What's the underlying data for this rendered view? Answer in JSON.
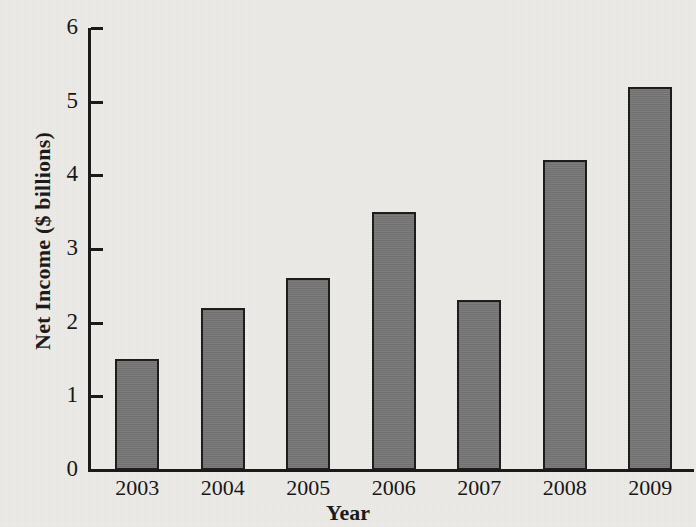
{
  "chart_data": {
    "type": "bar",
    "title": "",
    "xlabel": "Year",
    "ylabel": "Net Income ($ billions)",
    "categories": [
      "2003",
      "2004",
      "2005",
      "2006",
      "2007",
      "2008",
      "2009"
    ],
    "values": [
      1.5,
      2.2,
      2.6,
      3.5,
      2.3,
      4.2,
      5.2
    ],
    "ylim": [
      0,
      6
    ],
    "ytick_labels": [
      "0",
      "1",
      "2",
      "3",
      "4",
      "5",
      "6"
    ],
    "ytick_values": [
      0,
      1,
      2,
      3,
      4,
      5,
      6
    ],
    "grid": false,
    "legend": null,
    "series": [
      {
        "name": "Net Income",
        "values": [
          1.5,
          2.2,
          2.6,
          3.5,
          2.3,
          4.2,
          5.2
        ],
        "color": "#767676"
      }
    ]
  },
  "style": {
    "background": "#ecebe7",
    "bar_fill": "#767676",
    "bar_outline": "#1d1d1d",
    "axis_color": "#1a1a1a",
    "text_color": "#171717"
  }
}
